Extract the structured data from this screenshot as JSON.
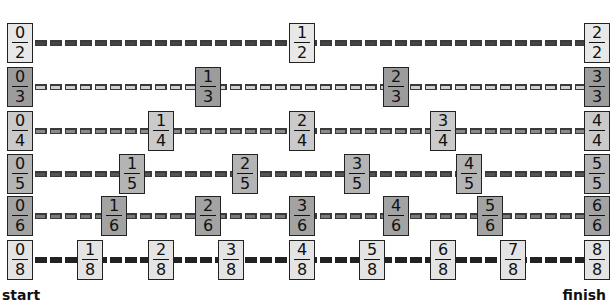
{
  "labels": {
    "start": "start",
    "finish": "finish"
  },
  "rows": [
    {
      "denominator": 2,
      "center_y": 43,
      "box_color": "#e8e8e8",
      "line_color": "#3a3a3a",
      "line_fill": "#444444",
      "fractions": [
        {
          "n": "0",
          "d": "2",
          "x": 20
        },
        {
          "n": "1",
          "d": "2",
          "x": 302
        },
        {
          "n": "2",
          "d": "2",
          "x": 597
        }
      ]
    },
    {
      "denominator": 3,
      "center_y": 87,
      "box_color": "#9c9c9c",
      "line_color": "#3a3a3a",
      "line_fill": "#cfcfcf",
      "fractions": [
        {
          "n": "0",
          "d": "3",
          "x": 20
        },
        {
          "n": "1",
          "d": "3",
          "x": 208
        },
        {
          "n": "2",
          "d": "3",
          "x": 396
        },
        {
          "n": "3",
          "d": "3",
          "x": 597
        }
      ]
    },
    {
      "denominator": 4,
      "center_y": 131,
      "box_color": "#cacaca",
      "line_color": "#3a3a3a",
      "line_fill": "#8a8a8a",
      "fractions": [
        {
          "n": "0",
          "d": "4",
          "x": 20
        },
        {
          "n": "1",
          "d": "4",
          "x": 161
        },
        {
          "n": "2",
          "d": "4",
          "x": 302
        },
        {
          "n": "3",
          "d": "4",
          "x": 443
        },
        {
          "n": "4",
          "d": "4",
          "x": 597
        }
      ]
    },
    {
      "denominator": 5,
      "center_y": 174,
      "box_color": "#b4b4b4",
      "line_color": "#3a3a3a",
      "line_fill": "#555555",
      "fractions": [
        {
          "n": "0",
          "d": "5",
          "x": 20
        },
        {
          "n": "1",
          "d": "5",
          "x": 132
        },
        {
          "n": "2",
          "d": "5",
          "x": 245
        },
        {
          "n": "3",
          "d": "5",
          "x": 357
        },
        {
          "n": "4",
          "d": "5",
          "x": 469
        },
        {
          "n": "5",
          "d": "5",
          "x": 597
        }
      ]
    },
    {
      "denominator": 6,
      "center_y": 216,
      "box_color": "#a3a3a3",
      "line_color": "#3a3a3a",
      "line_fill": "#7a7a7a",
      "fractions": [
        {
          "n": "0",
          "d": "6",
          "x": 20
        },
        {
          "n": "1",
          "d": "6",
          "x": 114
        },
        {
          "n": "2",
          "d": "6",
          "x": 208
        },
        {
          "n": "3",
          "d": "6",
          "x": 302
        },
        {
          "n": "4",
          "d": "6",
          "x": 396
        },
        {
          "n": "5",
          "d": "6",
          "x": 490
        },
        {
          "n": "6",
          "d": "6",
          "x": 597
        }
      ]
    },
    {
      "denominator": 8,
      "center_y": 260,
      "box_color": "#e4e4e4",
      "line_color": "#222222",
      "line_fill": "#222222",
      "fractions": [
        {
          "n": "0",
          "d": "8",
          "x": 20
        },
        {
          "n": "1",
          "d": "8",
          "x": 90
        },
        {
          "n": "2",
          "d": "8",
          "x": 161
        },
        {
          "n": "3",
          "d": "8",
          "x": 231
        },
        {
          "n": "4",
          "d": "8",
          "x": 302
        },
        {
          "n": "5",
          "d": "8",
          "x": 372
        },
        {
          "n": "6",
          "d": "8",
          "x": 443
        },
        {
          "n": "7",
          "d": "8",
          "x": 513
        },
        {
          "n": "8",
          "d": "8",
          "x": 597
        }
      ]
    }
  ]
}
